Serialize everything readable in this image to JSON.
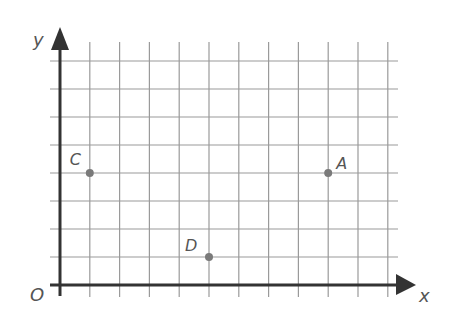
{
  "chart_data": {
    "type": "scatter",
    "title": "",
    "xlabel": "x",
    "ylabel": "y",
    "origin_label": "O",
    "grid": true,
    "xlim": [
      0,
      11
    ],
    "ylim": [
      0,
      8
    ],
    "points": [
      {
        "label": "A",
        "x": 9,
        "y": 4
      },
      {
        "label": "C",
        "x": 1,
        "y": 4
      },
      {
        "label": "D",
        "x": 5,
        "y": 1
      }
    ]
  },
  "colors": {
    "grid": "#9a9a9a",
    "axis": "#333333",
    "point": "#7a7a7a",
    "label": "#555555"
  }
}
